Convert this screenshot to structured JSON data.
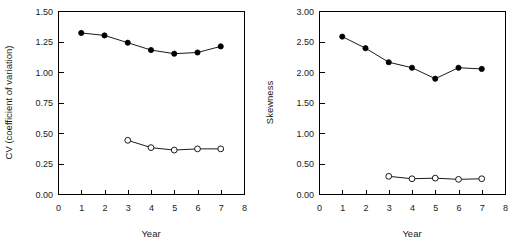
{
  "figure": {
    "background": "#ffffff",
    "ink_color": "#000000",
    "panel_count": 2
  },
  "chart_data": [
    {
      "id": "cv-panel",
      "type": "line",
      "title": "",
      "xlabel": "Year",
      "ylabel": "CV (coefficient of variation)",
      "xlim": [
        0,
        8
      ],
      "ylim": [
        0.0,
        1.5
      ],
      "xticks": [
        0,
        1,
        2,
        3,
        4,
        5,
        6,
        7,
        8
      ],
      "xticklabels": [
        "0",
        "1",
        "2",
        "3",
        "4",
        "5",
        "6",
        "7",
        "8"
      ],
      "yticks": [
        0.0,
        0.25,
        0.5,
        0.75,
        1.0,
        1.25,
        1.5
      ],
      "yticklabels": [
        "0.00",
        "0.25",
        "0.50",
        "0.75",
        "1.00",
        "1.25",
        "1.50"
      ],
      "grid": false,
      "legend": "none",
      "frame": "box",
      "series": [
        {
          "name": "filled-circles",
          "marker": "filled-circle",
          "x": [
            1,
            2,
            3,
            4,
            5,
            6,
            7
          ],
          "values": [
            1.32,
            1.3,
            1.24,
            1.18,
            1.15,
            1.16,
            1.21
          ]
        },
        {
          "name": "open-circles",
          "marker": "open-circle",
          "x": [
            3,
            4,
            5,
            6,
            7
          ],
          "values": [
            0.44,
            0.38,
            0.36,
            0.37,
            0.37
          ]
        }
      ]
    },
    {
      "id": "skewness-panel",
      "type": "line",
      "title": "",
      "xlabel": "Year",
      "ylabel": "Skewness",
      "xlim": [
        0,
        8
      ],
      "ylim": [
        0.0,
        3.0
      ],
      "xticks": [
        0,
        1,
        2,
        3,
        4,
        5,
        6,
        7,
        8
      ],
      "xticklabels": [
        "0",
        "1",
        "2",
        "3",
        "4",
        "5",
        "6",
        "7",
        "8"
      ],
      "yticks": [
        0.0,
        0.5,
        1.0,
        1.5,
        2.0,
        2.5,
        3.0
      ],
      "yticklabels": [
        "0.00",
        "0.50",
        "1.00",
        "1.50",
        "2.00",
        "2.50",
        "3.00"
      ],
      "grid": false,
      "legend": "none",
      "frame": "box",
      "series": [
        {
          "name": "filled-circles",
          "marker": "filled-circle",
          "x": [
            1,
            2,
            3,
            4,
            5,
            6,
            7
          ],
          "values": [
            2.58,
            2.39,
            2.16,
            2.07,
            1.89,
            2.07,
            2.05
          ]
        },
        {
          "name": "open-circles",
          "marker": "open-circle",
          "x": [
            3,
            4,
            5,
            6,
            7
          ],
          "values": [
            0.29,
            0.25,
            0.26,
            0.24,
            0.25
          ]
        }
      ]
    }
  ]
}
